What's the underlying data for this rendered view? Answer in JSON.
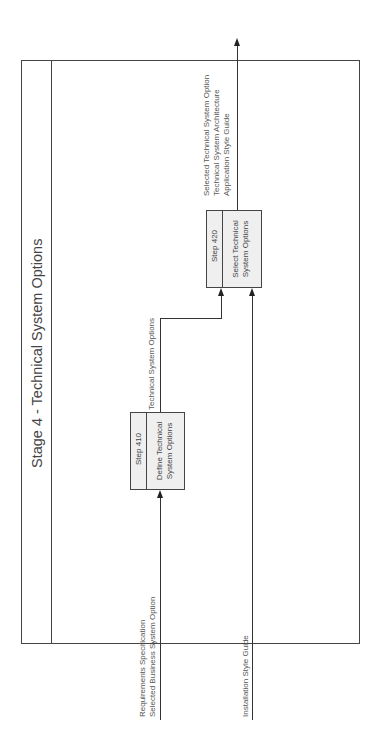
{
  "diagram": {
    "title": "Stage 4 - Technical System Options",
    "steps": [
      {
        "id": "Step 410",
        "name_lines": [
          "Define Technical",
          "System Options"
        ]
      },
      {
        "id": "Step 420",
        "name_lines": [
          "Select Technical",
          "System Options"
        ]
      }
    ],
    "inputs": {
      "step410": [
        "Requirements Specification",
        "Selected Business System Option"
      ],
      "step420_external": [
        "Installation Style Guide"
      ]
    },
    "intermediate": {
      "step410_to_step420": "Technical System Options"
    },
    "outputs": {
      "step420": [
        "Selected Technical System Option",
        "Technical System Architecture",
        "Application Style Guide"
      ]
    },
    "colors": {
      "box_fill": "#efefef",
      "line": "#333333",
      "text": "#444444"
    }
  }
}
